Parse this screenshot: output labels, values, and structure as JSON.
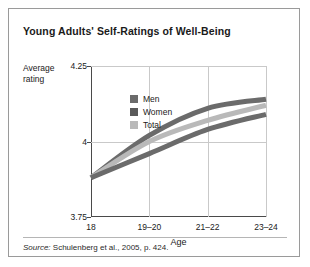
{
  "figure": {
    "title": "Young Adults' Self-Ratings of Well-Being",
    "source_prefix": "Source:",
    "source_text": " Schulenberg et al., 2005, p. 424.",
    "border_color": "#9a9a9a"
  },
  "chart_data": {
    "type": "line",
    "title": "Young Adults' Self-Ratings of Well-Being",
    "xlabel": "Age",
    "ylabel": "Average rating",
    "categories": [
      "18",
      "19–20",
      "21–22",
      "23–24"
    ],
    "ylim": [
      3.75,
      4.25
    ],
    "yticks": [
      "3.75",
      "4",
      "4.25"
    ],
    "ytick_values": [
      3.75,
      4,
      4.25
    ],
    "grid": true,
    "legend_position": "inside-bottom-right",
    "series": [
      {
        "name": "Women",
        "values": [
          3.88,
          4.02,
          4.11,
          4.14
        ],
        "color": "#6b6b6b"
      },
      {
        "name": "Total",
        "values": [
          3.88,
          4.0,
          4.07,
          4.12
        ],
        "color": "#b9b9b9"
      },
      {
        "name": "Men",
        "values": [
          3.88,
          3.96,
          4.04,
          4.09
        ],
        "color": "#6b6b6b"
      }
    ]
  },
  "legend": {
    "items": [
      {
        "label": "Men",
        "color": "#6b6b6b"
      },
      {
        "label": "Women",
        "color": "#5a5a5a"
      },
      {
        "label": "Total",
        "color": "#b9b9b9"
      }
    ]
  }
}
